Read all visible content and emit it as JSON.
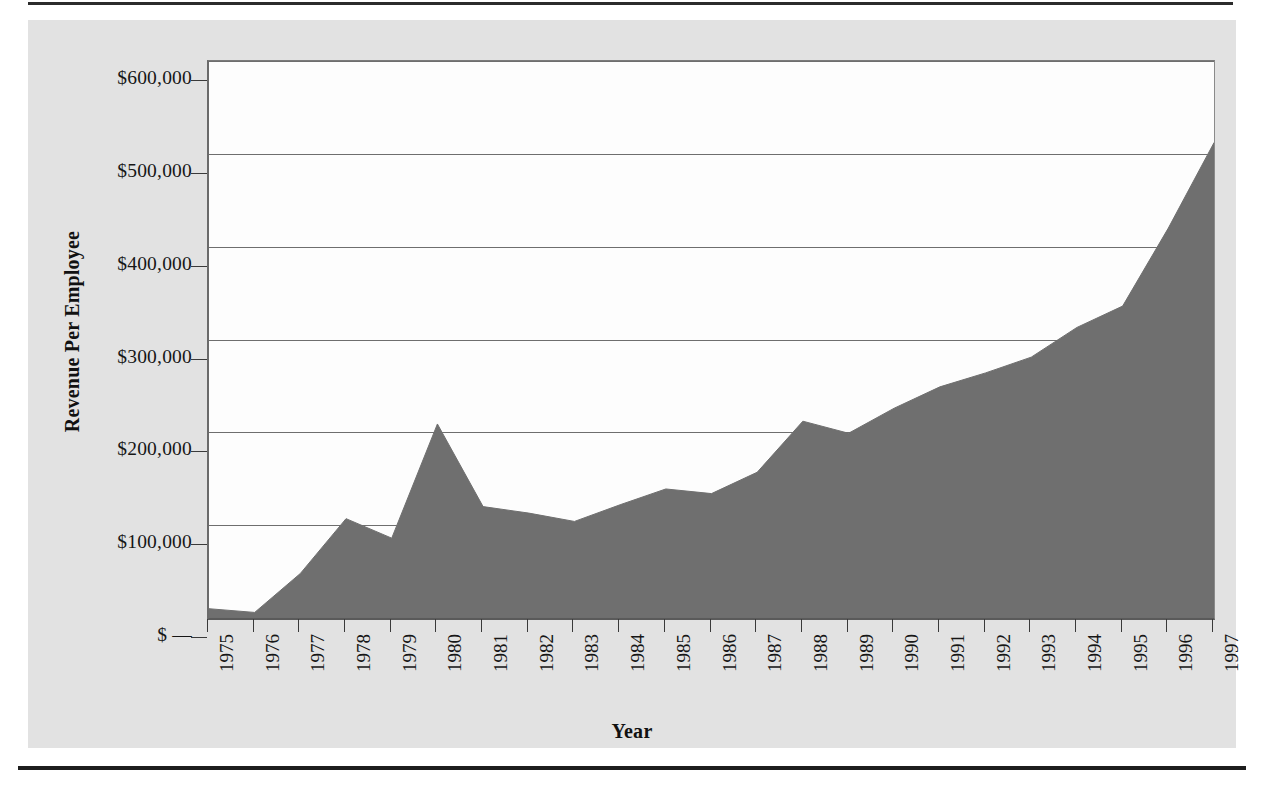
{
  "chart_data": {
    "type": "area",
    "title": "",
    "xlabel": "Year",
    "ylabel": "Revenue Per Employee",
    "x": [
      1975,
      1976,
      1977,
      1978,
      1979,
      1980,
      1981,
      1982,
      1983,
      1984,
      1985,
      1986,
      1987,
      1988,
      1989,
      1990,
      1991,
      1992,
      1993,
      1994,
      1995,
      1996,
      1997
    ],
    "categories": [
      "1975",
      "1976",
      "1977",
      "1978",
      "1979",
      "1980",
      "1981",
      "1982",
      "1983",
      "1984",
      "1985",
      "1986",
      "1987",
      "1988",
      "1989",
      "1990",
      "1991",
      "1992",
      "1993",
      "1994",
      "1995",
      "1996",
      "1997"
    ],
    "values": [
      10000,
      6000,
      48000,
      107000,
      86000,
      209000,
      120000,
      113000,
      104000,
      122000,
      139000,
      134000,
      157000,
      212000,
      199000,
      226000,
      249000,
      264000,
      281000,
      313000,
      336000,
      420000,
      512000
    ],
    "series": [
      {
        "name": "Revenue Per Employee",
        "values": [
          10000,
          6000,
          48000,
          107000,
          86000,
          209000,
          120000,
          113000,
          104000,
          122000,
          139000,
          134000,
          157000,
          212000,
          199000,
          226000,
          249000,
          264000,
          281000,
          313000,
          336000,
          420000,
          512000
        ]
      }
    ],
    "ylim": [
      0,
      600000
    ],
    "yticks": [
      0,
      100000,
      200000,
      300000,
      400000,
      500000,
      600000
    ],
    "ytick_labels": [
      "$ —",
      "$100,000",
      "$200,000",
      "$300,000",
      "$400,000",
      "$500,000",
      "$600,000"
    ],
    "grid": true,
    "legend": "none",
    "fill_color": "#6f6f6f",
    "plot_background": "#fdfdfd",
    "panel_background": "#e2e2e2",
    "gridline_color": "#6e6e6e",
    "axis_color": "#3a3a3a"
  },
  "axes": {
    "y_title": "Revenue Per Employee",
    "x_title": "Year"
  }
}
